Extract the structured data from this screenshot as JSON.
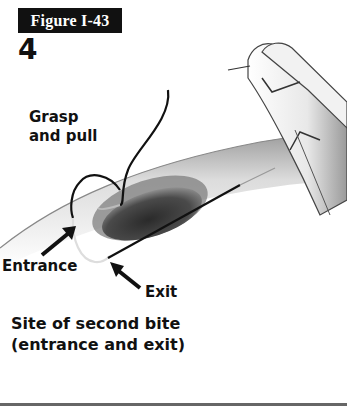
{
  "figure": {
    "label": "Figure I-43",
    "step_number": "4"
  },
  "annotations": {
    "grasp_line1": "Grasp",
    "grasp_line2": "and pull",
    "entrance": "Entrance",
    "exit": "Exit"
  },
  "caption": {
    "line1": "Site of second bite",
    "line2": "(entrance and exit)"
  },
  "colors": {
    "label_bg": "#111111",
    "label_text": "#ffffff",
    "text": "#111111",
    "rule": "#666666"
  }
}
